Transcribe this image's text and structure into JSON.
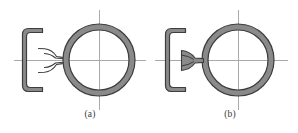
{
  "figure": {
    "background_color": "#ffffff",
    "outline_color": "#3d3d3d",
    "section_fill_color": "#8a8a8a",
    "centerline_color": "#a8a8a8",
    "panels": [
      {
        "id": "a",
        "caption": "(a)",
        "description": "Cross-section of a flanged bracket with a sharp stepped neck joining a ring section",
        "neck_type": "sharp-step",
        "bracket": {
          "x": 22,
          "y": 28,
          "width": 20,
          "height": 64,
          "wall_thickness": 4,
          "open_side": "right"
        },
        "ring": {
          "center_x": 99,
          "center_y": 60,
          "outer_radius": 36,
          "inner_radius": 30
        },
        "centerlines": {
          "horizontal_y": 60,
          "horizontal_x1": 14,
          "horizontal_x2": 146,
          "vertical_x": 99,
          "vertical_y1": 10,
          "vertical_y2": 110
        }
      },
      {
        "id": "b",
        "caption": "(b)",
        "description": "Cross-section of a flanged bracket with a smooth filleted neck joining a ring section",
        "neck_type": "filleted-taper",
        "bracket": {
          "x": 165,
          "y": 28,
          "width": 20,
          "height": 64,
          "wall_thickness": 4,
          "open_side": "right"
        },
        "ring": {
          "center_x": 238,
          "center_y": 60,
          "outer_radius": 36,
          "inner_radius": 30
        },
        "centerlines": {
          "horizontal_y": 60,
          "horizontal_x1": 155,
          "horizontal_x2": 288,
          "vertical_x": 238,
          "vertical_y1": 10,
          "vertical_y2": 110
        }
      }
    ],
    "source_note": ""
  }
}
